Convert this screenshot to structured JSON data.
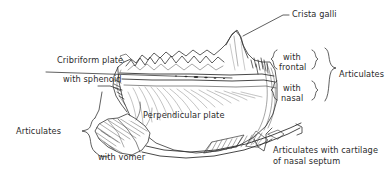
{
  "figure": {
    "view": "lateral / oblique line drawing",
    "background_color": "#ffffff",
    "ink_color": "#2b2b2b",
    "line_color": "#333333"
  },
  "labels": {
    "crista_galli": "Crista galli",
    "cribriform_plate": "Cribriform plate",
    "with_sphenoid": "with sphenoid",
    "perpendicular_plate": "Perpendicular plate",
    "with_vomer": "with vomer",
    "articulates_left": "Articulates",
    "articulates_right": "Articulates",
    "with_frontal_line1": "with",
    "with_frontal_line2": "frontal",
    "with_nasal_line1": "with",
    "with_nasal_line2": "nasal",
    "cartilage_line1": "Articulates with cartilage",
    "cartilage_line2": "of nasal septum"
  }
}
